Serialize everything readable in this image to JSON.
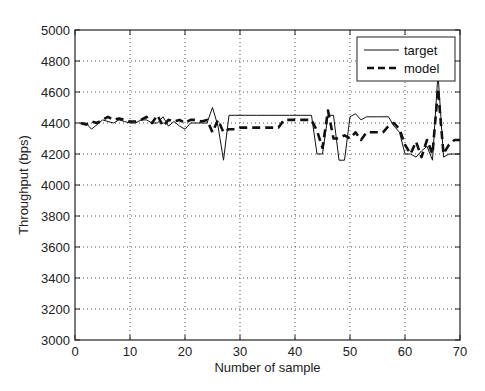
{
  "chart_data": {
    "type": "line",
    "title": "",
    "xlabel": "Number of sample",
    "ylabel": "Throughput (bps)",
    "xlim": [
      0,
      70
    ],
    "ylim": [
      3000,
      5000
    ],
    "xticks": [
      0,
      10,
      20,
      30,
      40,
      50,
      60,
      70
    ],
    "yticks": [
      3000,
      3200,
      3400,
      3600,
      3800,
      4000,
      4200,
      4400,
      4600,
      4800,
      5000
    ],
    "grid": true,
    "legend_position": "top-right",
    "x": [
      1,
      2,
      3,
      4,
      5,
      6,
      7,
      8,
      9,
      10,
      11,
      12,
      13,
      14,
      15,
      16,
      17,
      18,
      19,
      20,
      21,
      22,
      23,
      24,
      25,
      26,
      27,
      28,
      29,
      30,
      31,
      32,
      33,
      34,
      35,
      36,
      37,
      38,
      39,
      40,
      41,
      42,
      43,
      44,
      45,
      46,
      47,
      48,
      49,
      50,
      51,
      52,
      53,
      54,
      55,
      56,
      57,
      58,
      59,
      60,
      61,
      62,
      63,
      64,
      65,
      66,
      67,
      68,
      69,
      70
    ],
    "series": [
      {
        "name": "target",
        "style": "solid",
        "values": [
          4400,
          4400,
          4360,
          4390,
          4420,
          4410,
          4400,
          4420,
          4410,
          4400,
          4400,
          4420,
          4420,
          4400,
          4400,
          4440,
          4380,
          4410,
          4380,
          4360,
          4400,
          4400,
          4400,
          4400,
          4500,
          4380,
          4160,
          4450,
          4450,
          4450,
          4450,
          4450,
          4450,
          4450,
          4450,
          4450,
          4450,
          4450,
          4450,
          4450,
          4450,
          4450,
          4450,
          4200,
          4200,
          4450,
          4450,
          4160,
          4160,
          4440,
          4460,
          4420,
          4440,
          4440,
          4440,
          4440,
          4440,
          4380,
          4340,
          4200,
          4200,
          4180,
          4220,
          4250,
          4160,
          4720,
          4180,
          4200,
          4200,
          4200
        ]
      },
      {
        "name": "model",
        "style": "dashed",
        "values": [
          4400,
          4390,
          4410,
          4400,
          4420,
          4440,
          4420,
          4430,
          4420,
          4410,
          4410,
          4420,
          4440,
          4400,
          4450,
          4380,
          4420,
          4410,
          4420,
          4400,
          4420,
          4420,
          4410,
          4420,
          4340,
          4420,
          4340,
          4360,
          4360,
          4370,
          4370,
          4370,
          4370,
          4370,
          4370,
          4370,
          4370,
          4420,
          4420,
          4420,
          4420,
          4420,
          4420,
          4350,
          4240,
          4480,
          4300,
          4300,
          4320,
          4300,
          4340,
          4290,
          4340,
          4340,
          4340,
          4340,
          4380,
          4400,
          4360,
          4260,
          4200,
          4280,
          4180,
          4290,
          4200,
          4620,
          4200,
          4260,
          4290,
          4290
        ]
      }
    ]
  }
}
